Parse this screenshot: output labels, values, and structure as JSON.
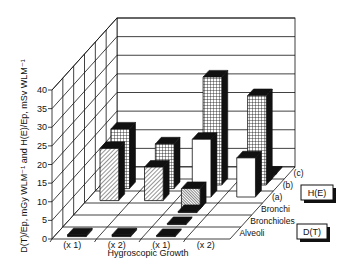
{
  "chart_data": {
    "type": "bar",
    "subtype": "3d-grouped-bar",
    "title": "",
    "ylabel": "D(T)/Ep, mGy WLM⁻¹ and H(E)/Ep, mSv WLM⁻¹",
    "xlabel": "Hygroscopic Growth",
    "ylim": [
      0,
      40
    ],
    "yticks": [
      0,
      5,
      10,
      15,
      20,
      25,
      30,
      35,
      40
    ],
    "categories": [
      "(x 1)",
      "(x 2)",
      "(x 1)",
      "(x 2)"
    ],
    "depth_categories": [
      "Alveoli",
      "Bronchioles",
      "Bronchi",
      "(a)",
      "(b)",
      "(c)"
    ],
    "legend": [
      {
        "key": "H(E)",
        "label": "H(E)"
      },
      {
        "key": "D(T)",
        "label": "D(T)"
      }
    ],
    "bars": [
      {
        "category": 0,
        "depth": 0,
        "series": "D(T)",
        "pattern": "solid-black",
        "value": 0.5
      },
      {
        "category": 0,
        "depth": 3,
        "series": "D(T)",
        "pattern": "hatched",
        "value": 14
      },
      {
        "category": 0,
        "depth": 4,
        "series": "H(E)",
        "pattern": "grid",
        "value": 16
      },
      {
        "category": 1,
        "depth": 0,
        "series": "D(T)",
        "pattern": "solid-black",
        "value": 0.5
      },
      {
        "category": 1,
        "depth": 3,
        "series": "D(T)",
        "pattern": "hatched",
        "value": 9
      },
      {
        "category": 1,
        "depth": 4,
        "series": "H(E)",
        "pattern": "grid",
        "value": 12
      },
      {
        "category": 2,
        "depth": 0,
        "series": "D(T)",
        "pattern": "solid-black",
        "value": 0.3
      },
      {
        "category": 2,
        "depth": 1,
        "series": "D(T)",
        "pattern": "solid-black",
        "value": 0.3
      },
      {
        "category": 2,
        "depth": 2,
        "series": "D(T)",
        "pattern": "solid-black",
        "value": 0.3
      },
      {
        "category": 2,
        "depth": 2.3,
        "series": "D(T)",
        "pattern": "dense-hatched",
        "value": 5.5
      },
      {
        "category": 2,
        "depth": 3.3,
        "series": "D(T)",
        "pattern": "white",
        "value": 15.5
      },
      {
        "category": 2,
        "depth": 4.3,
        "series": "H(E)",
        "pattern": "grid",
        "value": 29
      },
      {
        "category": 3,
        "depth": 3.3,
        "series": "D(T)",
        "pattern": "white",
        "value": 10.5
      },
      {
        "category": 3,
        "depth": 4.3,
        "series": "H(E)",
        "pattern": "grid",
        "value": 24
      },
      {
        "category": 3,
        "depth": 4.7,
        "series": "D(T)",
        "pattern": "solid-black",
        "value": 0.3
      },
      {
        "category": 3,
        "depth": 5.2,
        "series": "H(E)",
        "pattern": "solid-black",
        "value": 0.3
      }
    ],
    "grid": true,
    "legend_position": "right"
  },
  "labels": {
    "ylabel": "D(T)/Ep, mGy WLM⁻¹ and H(E)/Ep, mSv WLM⁻¹",
    "xlabel": "Hygroscopic Growth",
    "legend_he": "H(E)",
    "legend_dt": "D(T)"
  }
}
